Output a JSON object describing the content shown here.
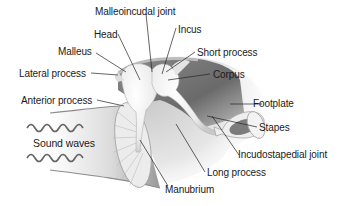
{
  "diagram": {
    "labels": {
      "malleoincudal_joint": "Malleoincudal joint",
      "head": "Head",
      "malleus": "Malleus",
      "lateral_process": "Lateral process",
      "anterior_process": "Anterior process",
      "sound_waves": "Sound waves",
      "incus": "Incus",
      "short_process": "Short process",
      "corpus": "Corpus",
      "footplate": "Footplate",
      "stapes": "Stapes",
      "incudostapedial_joint": "Incudostapedial joint",
      "long_process": "Long process",
      "manubrium": "Manubrium"
    },
    "colors": {
      "background": "#ffffff",
      "cavity_dark": "#6e6e6e",
      "cavity_mid": "#a8a8a8",
      "bone_light": "#f2f2f2",
      "wave": "#666666",
      "leader_line": "#222222",
      "text": "#1a1a1a"
    }
  }
}
